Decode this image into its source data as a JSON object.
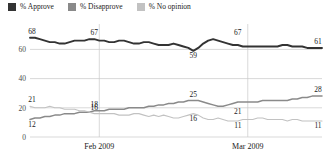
{
  "legend": {
    "position": "top-left",
    "items": [
      {
        "label": "% Approve",
        "color": "#333333",
        "icon": "square-swatch-icon"
      },
      {
        "label": "% Disapprove",
        "color": "#8a8a8a",
        "icon": "square-swatch-icon"
      },
      {
        "label": "% No opinion",
        "color": "#c2c2c2",
        "icon": "square-swatch-icon"
      }
    ]
  },
  "axes": {
    "y_ticks": [
      "0",
      "20",
      "40",
      "60"
    ],
    "x_ticks": [
      "Feb 2009",
      "Mar 2009"
    ],
    "ylim": [
      0,
      72
    ],
    "grid": "horizontal-and-vertical"
  },
  "annotations": {
    "approve": [
      "68",
      "67",
      "59",
      "67",
      "61"
    ],
    "disapprove": [
      "12",
      "18",
      "25",
      "21",
      "28"
    ],
    "noopinion": [
      "21",
      "16",
      "16",
      "11",
      "11"
    ]
  },
  "chart_data": {
    "type": "line",
    "title": "",
    "xlabel": "",
    "ylabel": "",
    "ylim": [
      0,
      72
    ],
    "grid": true,
    "legend_position": "top-left",
    "x_tick_labels": [
      "Feb 2009",
      "Mar 2009"
    ],
    "x_tick_index": [
      14,
      44
    ],
    "y_tick_values": [
      0,
      20,
      40,
      60
    ],
    "n_points": 60,
    "series": [
      {
        "name": "% Approve",
        "color": "#333333",
        "labels": [
          {
            "index": 0,
            "value": 68
          },
          {
            "index": 13,
            "value": 67
          },
          {
            "index": 33,
            "value": 59
          },
          {
            "index": 42,
            "value": 67
          },
          {
            "index": 59,
            "value": 61
          }
        ],
        "values": [
          68,
          68,
          67,
          66,
          65,
          65,
          64,
          64,
          65,
          66,
          66,
          66,
          67,
          67,
          66,
          66,
          65,
          65,
          66,
          66,
          65,
          64,
          64,
          65,
          65,
          64,
          63,
          63,
          63,
          64,
          63,
          62,
          61,
          59,
          61,
          64,
          66,
          67,
          66,
          65,
          64,
          63,
          63,
          62,
          62,
          62,
          62,
          62,
          62,
          62,
          62,
          63,
          63,
          62,
          62,
          62,
          61,
          61,
          61,
          61
        ]
      },
      {
        "name": "% Disapprove",
        "color": "#8a8a8a",
        "labels": [
          {
            "index": 0,
            "value": 12
          },
          {
            "index": 13,
            "value": 18
          },
          {
            "index": 33,
            "value": 25
          },
          {
            "index": 42,
            "value": 21
          },
          {
            "index": 59,
            "value": 28
          }
        ],
        "values": [
          12,
          13,
          13,
          14,
          14,
          15,
          15,
          16,
          16,
          16,
          17,
          17,
          17,
          18,
          18,
          18,
          19,
          19,
          19,
          19,
          20,
          20,
          20,
          20,
          21,
          21,
          22,
          22,
          23,
          23,
          24,
          24,
          25,
          25,
          25,
          24,
          23,
          22,
          21,
          21,
          22,
          23,
          24,
          24,
          24,
          24,
          24,
          25,
          25,
          25,
          25,
          25,
          25,
          26,
          26,
          27,
          27,
          28,
          28,
          28
        ]
      },
      {
        "name": "% No opinion",
        "color": "#c2c2c2",
        "labels": [
          {
            "index": 0,
            "value": 21
          },
          {
            "index": 13,
            "value": 16
          },
          {
            "index": 33,
            "value": 16
          },
          {
            "index": 42,
            "value": 11
          },
          {
            "index": 59,
            "value": 11
          }
        ],
        "values": [
          21,
          20,
          20,
          20,
          21,
          20,
          20,
          19,
          19,
          19,
          18,
          18,
          17,
          16,
          16,
          16,
          16,
          16,
          15,
          15,
          15,
          16,
          16,
          15,
          14,
          15,
          14,
          15,
          14,
          13,
          13,
          14,
          15,
          16,
          15,
          13,
          12,
          12,
          13,
          12,
          11,
          11,
          11,
          12,
          12,
          12,
          13,
          13,
          12,
          12,
          12,
          12,
          11,
          12,
          12,
          11,
          11,
          11,
          11,
          11
        ]
      }
    ]
  }
}
